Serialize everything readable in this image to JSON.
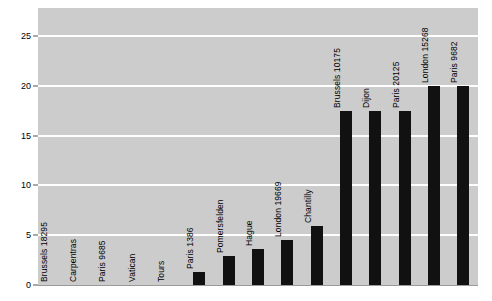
{
  "chart_data": {
    "type": "bar",
    "title": "",
    "xlabel": "",
    "ylabel": "",
    "ylim": [
      0,
      27.8
    ],
    "grid": true,
    "legend": null,
    "yticks": [
      0,
      5,
      10,
      15,
      20,
      25
    ],
    "categories": [
      "Brussels 18295",
      "Carpentras",
      "Paris 9685",
      "Vatican",
      "Tours",
      "Paris 1386",
      "Pomersfelden",
      "Hague",
      "London 19669",
      "Chantilly",
      "Brussels 10175",
      "Dijon",
      "Paris 20125",
      "London 15268",
      "Paris 9682"
    ],
    "values": [
      0,
      0,
      0,
      0,
      0,
      1.3,
      2.9,
      3.6,
      4.5,
      5.9,
      17.5,
      17.5,
      17.5,
      20.0,
      20.0
    ],
    "bar_color": "#111111",
    "plot_background": "#cccccc",
    "gridline_color": "#ffffff",
    "figure_background": "#ffffff"
  },
  "axis": {
    "tick_0": "0",
    "tick_5": "5",
    "tick_10": "10",
    "tick_15": "15",
    "tick_20": "20",
    "tick_25": "25"
  }
}
